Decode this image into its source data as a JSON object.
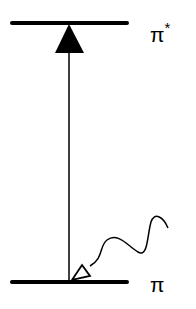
{
  "diagram": {
    "type": "energy-level-diagram",
    "levels": [
      {
        "id": "upper",
        "label": "π",
        "superscript": "*",
        "y": 23
      },
      {
        "id": "lower",
        "label": "π",
        "superscript": "",
        "y": 282
      }
    ],
    "transition": {
      "from": "lower",
      "to": "upper",
      "kind": "absorption-arrow"
    },
    "photon": {
      "kind": "wavy-arrow",
      "target": "lower"
    },
    "colors": {
      "line": "#000000",
      "background": "#ffffff"
    }
  }
}
